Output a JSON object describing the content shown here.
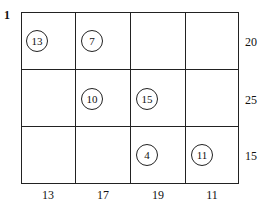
{
  "problem_number": "1",
  "grid": {
    "rows": 3,
    "cols": 4,
    "cells": [
      [
        "13",
        "7",
        "",
        ""
      ],
      [
        "",
        "10",
        "15",
        ""
      ],
      [
        "",
        "",
        "4",
        "11"
      ]
    ]
  },
  "row_labels": [
    "20",
    "25",
    "15"
  ],
  "col_labels": [
    "13",
    "17",
    "19",
    "11"
  ]
}
